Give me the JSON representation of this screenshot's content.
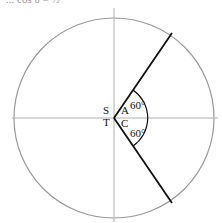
{
  "diagram": {
    "title_fragment": "...  cos θ = ½",
    "quadrant_labels": {
      "second": "S",
      "first": "A",
      "third": "T",
      "fourth": "C"
    },
    "angles": {
      "upper": "60°",
      "lower": "60°"
    },
    "colors": {
      "axis": "#aaaaaa",
      "circle": "#999999",
      "terminal_lines": "#111111"
    }
  }
}
